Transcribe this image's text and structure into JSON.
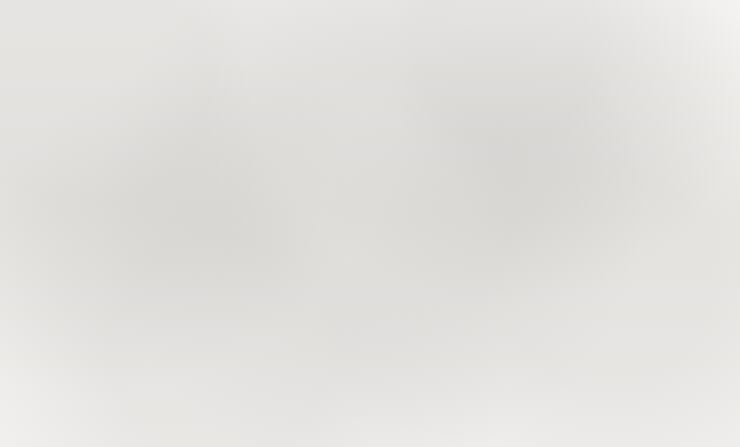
{
  "chart_data": {
    "type": "line",
    "title": "",
    "subtitle": "",
    "xlabel": "年份",
    "xlabel_display": "（年份）",
    "categories": [
      "2008",
      "2009",
      "2010",
      "2011",
      "2012",
      "2013",
      "2014"
    ],
    "x": [
      2008,
      2009,
      2010,
      2011,
      2012,
      2013,
      2014
    ],
    "grid": false,
    "legend_position": "bottom",
    "axes": {
      "left": {
        "ylabel": "",
        "ylim": [
          0,
          3000
        ],
        "ticks": [
          0,
          500,
          1000,
          1500,
          2000,
          2500,
          3000
        ],
        "tick_labels": [
          "0",
          "500",
          "1 000",
          "1 500",
          "2 000",
          "2 500",
          "3 000"
        ]
      },
      "right": {
        "ylabel": "%",
        "ylabel_display": "（%）",
        "ylim": [
          0,
          70
        ],
        "ticks": [
          0,
          10,
          20,
          30,
          40,
          50,
          60,
          70
        ],
        "tick_labels": [
          "0",
          "10",
          "20",
          "30",
          "40",
          "50",
          "60",
          "70"
        ]
      }
    },
    "series": [
      {
        "name": "全国",
        "axis": "left",
        "marker": "square",
        "color": "#6b6b6b",
        "values": [
          1220,
          1420,
          1670,
          1960,
          2240,
          2490,
          2680
        ]
      },
      {
        "name": "上海",
        "axis": "right",
        "marker": "diamond",
        "color": "#6b6b6b",
        "values": [
          37.5,
          41.5,
          52.5,
          56.5,
          58.5,
          39.0,
          39.0
        ]
      }
    ]
  },
  "legend": {
    "items": [
      {
        "label": "全国",
        "marker": "square"
      },
      {
        "label": "上海",
        "marker": "diamond"
      }
    ]
  }
}
